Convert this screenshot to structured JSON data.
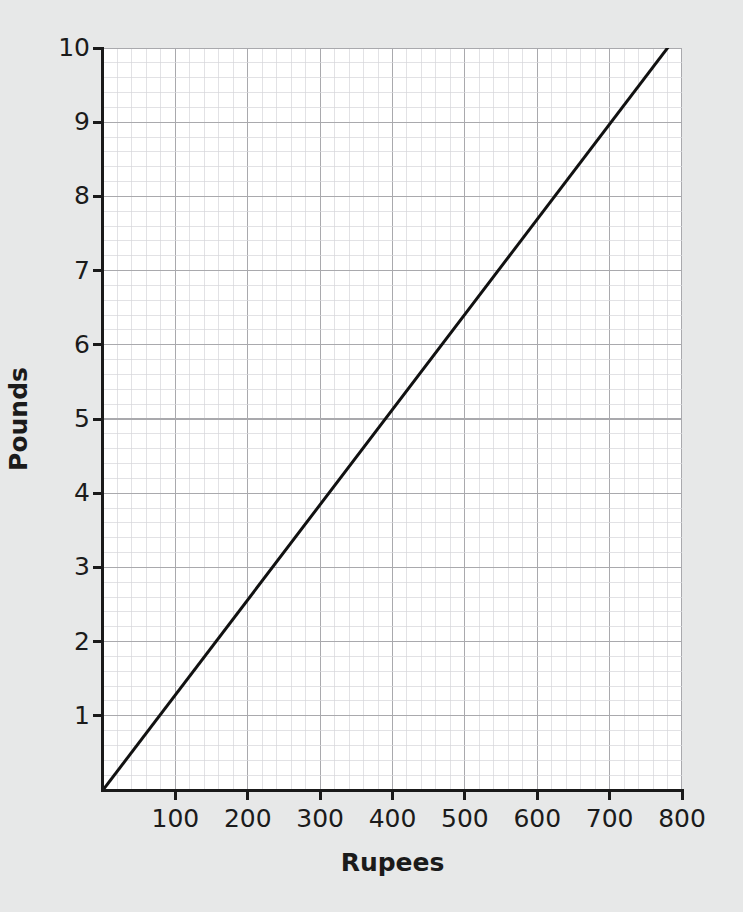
{
  "chart_data": {
    "type": "line",
    "title": "",
    "xlabel": "Rupees",
    "ylabel": "Pounds",
    "xlim": [
      0,
      800
    ],
    "ylim": [
      0,
      10
    ],
    "grid": true,
    "grid_major_x": 100,
    "grid_major_y": 1,
    "grid_minor_subdivisions": 5,
    "legend": "none",
    "x_tick_labels": [
      "100",
      "200",
      "300",
      "400",
      "500",
      "600",
      "700",
      "800"
    ],
    "x_tick_values": [
      100,
      200,
      300,
      400,
      500,
      600,
      700,
      800
    ],
    "y_tick_labels": [
      "1",
      "2",
      "3",
      "4",
      "5",
      "6",
      "7",
      "8",
      "9",
      "10"
    ],
    "y_tick_values": [
      1,
      2,
      3,
      4,
      5,
      6,
      7,
      8,
      9,
      10
    ],
    "series": [
      {
        "name": "Rupees to Pounds conversion",
        "color": "#111111",
        "line_width": 3,
        "x": [
          0,
          780
        ],
        "y": [
          0,
          10
        ],
        "points": [
          {
            "x": 0,
            "y": 0
          },
          {
            "x": 78,
            "y": 1
          },
          {
            "x": 156,
            "y": 2
          },
          {
            "x": 234,
            "y": 3
          },
          {
            "x": 312,
            "y": 4
          },
          {
            "x": 390,
            "y": 5
          },
          {
            "x": 468,
            "y": 6
          },
          {
            "x": 546,
            "y": 7
          },
          {
            "x": 624,
            "y": 8
          },
          {
            "x": 702,
            "y": 9
          },
          {
            "x": 780,
            "y": 10
          }
        ]
      }
    ],
    "colors": {
      "page_background": "#e7e8e8",
      "plot_background": "#ffffff",
      "axis": "#1a1a1a",
      "grid_major": "#a9a9ad",
      "grid_minor": "#d6d6da",
      "text": "#1b1b1b",
      "line": "#111111"
    }
  }
}
